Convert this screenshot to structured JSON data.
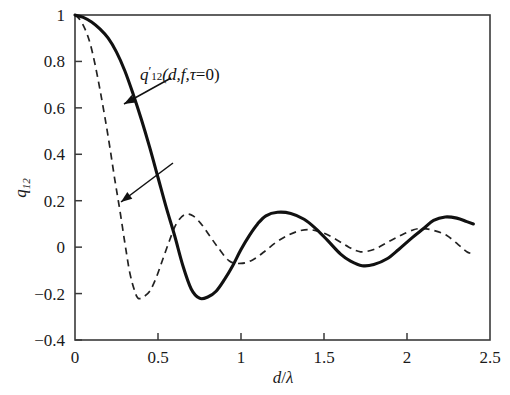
{
  "chart_data": {
    "type": "line",
    "title": "",
    "xlabel": "d/λ",
    "ylabel": "q12",
    "xlim": [
      0,
      2.5
    ],
    "ylim": [
      -0.4,
      1.0
    ],
    "xticks": [
      "0",
      "0.5",
      "1",
      "1.5",
      "2",
      "2.5"
    ],
    "xtick_values": [
      0,
      0.5,
      1,
      1.5,
      2,
      2.5
    ],
    "yticks": [
      "1",
      "0.8",
      "0.6",
      "0.4",
      "0.2",
      "0",
      "−0.2",
      "−0.4"
    ],
    "ytick_values": [
      1,
      0.8,
      0.6,
      0.4,
      0.2,
      0,
      -0.2,
      -0.4
    ],
    "grid": false,
    "legend": "none (inline annotations with leader arrows)",
    "series": [
      {
        "name": "q'12(d,f,τ=0)",
        "style": "solid",
        "color": "#111111",
        "x": [
          0.0,
          0.05,
          0.1,
          0.15,
          0.2,
          0.25,
          0.3,
          0.35,
          0.4,
          0.45,
          0.5,
          0.55,
          0.6,
          0.65,
          0.7,
          0.75,
          0.8,
          0.85,
          0.9,
          0.95,
          1.0,
          1.05,
          1.1,
          1.15,
          1.22,
          1.3,
          1.38,
          1.45,
          1.52,
          1.6,
          1.66,
          1.73,
          1.8,
          1.88,
          1.95,
          2.03,
          2.1,
          2.16,
          2.23,
          2.3,
          2.36,
          2.4
        ],
        "y": [
          1.0,
          0.99,
          0.97,
          0.94,
          0.9,
          0.84,
          0.76,
          0.66,
          0.55,
          0.43,
          0.3,
          0.17,
          0.05,
          -0.08,
          -0.18,
          -0.22,
          -0.215,
          -0.19,
          -0.14,
          -0.08,
          -0.01,
          0.05,
          0.1,
          0.135,
          0.15,
          0.145,
          0.12,
          0.08,
          0.03,
          -0.03,
          -0.06,
          -0.08,
          -0.075,
          -0.05,
          -0.01,
          0.04,
          0.08,
          0.115,
          0.13,
          0.125,
          0.11,
          0.1
        ]
      },
      {
        "name": "q'12(d,f,τ=d/c)",
        "style": "dashed",
        "color": "#222222",
        "x": [
          0.0,
          0.03,
          0.06,
          0.09,
          0.12,
          0.15,
          0.18,
          0.21,
          0.24,
          0.27,
          0.3,
          0.33,
          0.36,
          0.38,
          0.41,
          0.45,
          0.49,
          0.53,
          0.57,
          0.61,
          0.66,
          0.71,
          0.76,
          0.81,
          0.86,
          0.93,
          1.0,
          1.07,
          1.14,
          1.21,
          1.28,
          1.35,
          1.42,
          1.5,
          1.58,
          1.65,
          1.72,
          1.8,
          1.88,
          1.96,
          2.04,
          2.1,
          2.17,
          2.24,
          2.31,
          2.36,
          2.4
        ],
        "y": [
          1.0,
          0.98,
          0.94,
          0.88,
          0.79,
          0.68,
          0.56,
          0.43,
          0.29,
          0.16,
          0.02,
          -0.11,
          -0.19,
          -0.22,
          -0.215,
          -0.19,
          -0.13,
          -0.05,
          0.03,
          0.1,
          0.14,
          0.135,
          0.1,
          0.05,
          0.0,
          -0.06,
          -0.07,
          -0.055,
          -0.02,
          0.02,
          0.05,
          0.07,
          0.075,
          0.06,
          0.03,
          0.0,
          -0.02,
          -0.01,
          0.02,
          0.05,
          0.075,
          0.08,
          0.07,
          0.05,
          0.01,
          -0.02,
          -0.03
        ]
      }
    ],
    "annotations": [
      {
        "id": "annot-tau-zero",
        "text": "q'12(d,f,τ=0)",
        "label_html_parts": {
          "q": "q",
          "prime": "′",
          "sub": "12",
          "args": "(d,f,τ=0)"
        },
        "target_x": 0.26,
        "target_y": 0.63
      },
      {
        "id": "annot-tau-d-over-c",
        "text": "q'12(d,f,τ=d/c)",
        "label_html_parts": {
          "q": "q",
          "prime": "′",
          "sub": "12",
          "args_open": "(d,f,τ=",
          "numerator": "d",
          "denominator": "c",
          "args_close": ")"
        },
        "target_x": 0.2,
        "target_y": 0.2
      }
    ]
  },
  "figure": {
    "background_color": "#ffffff",
    "axis_color": "#3a3a3a",
    "solid_series_color": "#111111",
    "dashed_series_color": "#222222"
  }
}
